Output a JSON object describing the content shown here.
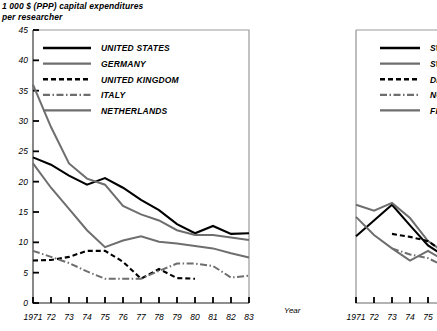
{
  "title": {
    "line1": "1 000 $ (PPP) capital expenditures",
    "line2": "per researcher"
  },
  "axis_label_x": "Year",
  "colors": {
    "black": "#000000",
    "gray": "#6e6e6e",
    "axis": "#808080"
  },
  "chart_data": [
    {
      "id": "left",
      "type": "line",
      "title": "1 000 $ (PPP) capital expenditures per researcher",
      "xlabel": "Year",
      "ylabel": "",
      "grid": false,
      "legend_position": "top-center",
      "x": [
        1971,
        1972,
        1973,
        1974,
        1975,
        1976,
        1977,
        1978,
        1979,
        1980,
        1981,
        1982,
        1983
      ],
      "xtick_labels": [
        "1971",
        "72",
        "73",
        "74",
        "75",
        "76",
        "77",
        "78",
        "79",
        "80",
        "81",
        "82",
        "83"
      ],
      "ytick_labels": [
        "0",
        "5",
        "10",
        "15",
        "20",
        "25",
        "30",
        "35",
        "40",
        "45"
      ],
      "ytick_values": [
        0,
        5,
        10,
        15,
        20,
        25,
        30,
        35,
        40,
        45
      ],
      "ylim": [
        0,
        45
      ],
      "series": [
        {
          "name": "UNITED STATES",
          "style": "solid",
          "color": "#000000",
          "values": [
            24.0,
            22.8,
            21.0,
            19.5,
            20.6,
            19.0,
            17.0,
            15.3,
            13.0,
            11.5,
            12.7,
            11.4,
            11.5
          ]
        },
        {
          "name": "GERMANY",
          "style": "solid",
          "color": "#6e6e6e",
          "values": [
            36.0,
            29.0,
            23.0,
            20.5,
            19.5,
            16.0,
            14.6,
            13.6,
            12.0,
            11.2,
            11.2,
            10.8,
            10.4
          ]
        },
        {
          "name": "UNITED KINGDOM",
          "style": "dashed",
          "color": "#000000",
          "values": [
            7.0,
            7.1,
            7.6,
            8.6,
            8.6,
            6.8,
            4.0,
            5.6,
            4.1,
            4.0,
            null,
            null,
            null
          ]
        },
        {
          "name": "ITALY",
          "style": "dashdot",
          "color": "#6e6e6e",
          "values": [
            8.6,
            7.6,
            6.6,
            5.2,
            4.0,
            4.0,
            4.0,
            5.3,
            6.5,
            6.5,
            6.1,
            4.2,
            4.5
          ]
        },
        {
          "name": "NETHERLANDS",
          "style": "solid",
          "color": "#6e6e6e",
          "values": [
            23.0,
            19.0,
            15.5,
            12.0,
            9.2,
            10.3,
            11.0,
            10.1,
            9.8,
            9.4,
            9.0,
            8.2,
            7.5
          ]
        }
      ]
    },
    {
      "id": "right",
      "type": "line",
      "note": "panel clipped at right edge of screenshot",
      "xlabel": "Year",
      "grid": false,
      "legend_position": "top-right",
      "x": [
        1971,
        1972,
        1973,
        1974,
        1975
      ],
      "xtick_labels": [
        "1971",
        "72",
        "73",
        "74",
        "75"
      ],
      "ylim": [
        0,
        45
      ],
      "series": [
        {
          "name": "SW",
          "style": "solid",
          "color": "#000000",
          "values": [
            11.0,
            13.6,
            16.2,
            12.8,
            9.5
          ]
        },
        {
          "name": "SW",
          "style": "solid",
          "color": "#6e6e6e",
          "values": [
            16.2,
            15.2,
            16.5,
            14.0,
            10.2
          ]
        },
        {
          "name": "DE",
          "style": "dashed",
          "color": "#000000",
          "values": [
            null,
            null,
            11.4,
            10.9,
            10.2
          ]
        },
        {
          "name": "NO",
          "style": "dashdot",
          "color": "#6e6e6e",
          "values": [
            null,
            null,
            9.0,
            8.0,
            7.4
          ]
        },
        {
          "name": "FIN",
          "style": "solid",
          "color": "#6e6e6e",
          "values": [
            14.2,
            11.2,
            9.0,
            7.0,
            8.6
          ]
        }
      ]
    }
  ],
  "legend_left": [
    {
      "label": "UNITED STATES",
      "style": "solid",
      "color": "#000000"
    },
    {
      "label": "GERMANY",
      "style": "solid",
      "color": "#6e6e6e"
    },
    {
      "label": "UNITED KINGDOM",
      "style": "dashed",
      "color": "#000000"
    },
    {
      "label": "ITALY",
      "style": "dashdot",
      "color": "#6e6e6e"
    },
    {
      "label": "NETHERLANDS",
      "style": "solid",
      "color": "#6e6e6e"
    }
  ],
  "legend_right": [
    {
      "label": "SW",
      "style": "solid",
      "color": "#000000"
    },
    {
      "label": "SW",
      "style": "solid",
      "color": "#6e6e6e"
    },
    {
      "label": "DE",
      "style": "dashed",
      "color": "#000000"
    },
    {
      "label": "NO",
      "style": "dashdot",
      "color": "#6e6e6e"
    },
    {
      "label": "FIN",
      "style": "solid",
      "color": "#6e6e6e"
    }
  ]
}
